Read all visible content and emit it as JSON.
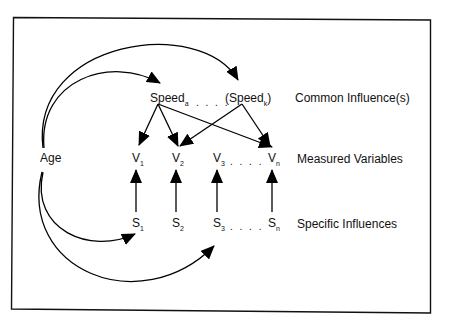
{
  "diagram": {
    "nodes": {
      "age": "Age",
      "speed_a": {
        "base": "Speed",
        "sub": "a"
      },
      "speed_k": {
        "pre": "(",
        "base": "Speed",
        "sub": "k",
        "post": ")"
      },
      "v1": {
        "base": "V",
        "sub": "1"
      },
      "v2": {
        "base": "V",
        "sub": "2"
      },
      "v3": {
        "base": "V",
        "sub": "3"
      },
      "vn": {
        "base": "V",
        "sub": "n"
      },
      "s1": {
        "base": "S",
        "sub": "1"
      },
      "s2": {
        "base": "S",
        "sub": "2"
      },
      "s3": {
        "base": "S",
        "sub": "3"
      },
      "sn": {
        "base": "S",
        "sub": "n"
      },
      "ellipsis": ". . . ."
    },
    "row_labels": {
      "common": "Common Influence(s)",
      "measured": "Measured Variables",
      "specific": "Specific Influences"
    }
  }
}
